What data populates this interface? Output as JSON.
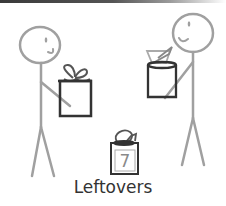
{
  "diagram": {
    "figures": [
      {
        "id": "left-person",
        "holds": "gift box with bow"
      },
      {
        "id": "right-person",
        "holds": "box with opened flap"
      }
    ],
    "leftovers_box": {
      "count": "7"
    },
    "label": "Leftovers"
  },
  "colors": {
    "figure_stroke": "#a0a0a0",
    "box_stroke": "#333333",
    "bow_stroke": "#555555",
    "label": "#333333",
    "count": "#8a8a8a"
  }
}
